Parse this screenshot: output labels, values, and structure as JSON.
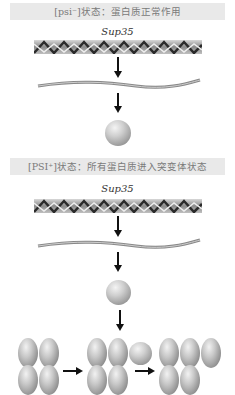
{
  "section1": {
    "title": "[psi⁻]状态：蛋白质正常作用",
    "gene_label": "Sup35"
  },
  "section2": {
    "title": "[PSI⁺]状态：所有蛋白质进入突变体状态",
    "gene_label": "Sup35"
  },
  "colors": {
    "banner_bg": "#e9e9e9",
    "banner_text": "#7a7a7a",
    "arrow": "#111111",
    "protein_gray": "#a8a8a8"
  }
}
